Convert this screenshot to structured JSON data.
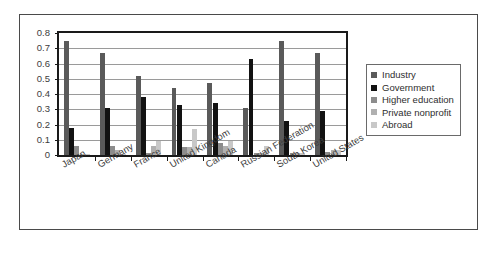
{
  "chart_data": {
    "type": "bar",
    "title": "",
    "subtitle": "",
    "xlabel": "",
    "ylabel": "",
    "ylim": [
      0,
      0.8
    ],
    "grid": true,
    "legend_position": "right",
    "categories": [
      "Japan",
      "Germany",
      "France",
      "United Kingdom",
      "Canada",
      "Russian Federation",
      "South Korea",
      "United States"
    ],
    "ytick_labels": [
      "0",
      "0.1",
      "0.2",
      "0.3",
      "0.4",
      "0.5",
      "0.6",
      "0.7",
      "0.8"
    ],
    "ytick_values": [
      0,
      0.1,
      0.2,
      0.3,
      0.4,
      0.5,
      0.6,
      0.7,
      0.8
    ],
    "series": [
      {
        "name": "Industry",
        "color": "#5a5a5a",
        "values": [
          0.75,
          0.67,
          0.52,
          0.44,
          0.47,
          0.31,
          0.75,
          0.67
        ]
      },
      {
        "name": "Government",
        "color": "#121212",
        "values": [
          0.18,
          0.31,
          0.38,
          0.33,
          0.34,
          0.63,
          0.22,
          0.29
        ]
      },
      {
        "name": "Higher education",
        "color": "#8c8c8c",
        "values": [
          0.06,
          0.06,
          0.01,
          0.05,
          0.08,
          0.01,
          0.01,
          0.02
        ]
      },
      {
        "name": "Private nonprofit",
        "color": "#b0b0b0",
        "values": [
          0.005,
          0.03,
          0.06,
          0.05,
          0.06,
          0.01,
          0.01,
          0.03
        ]
      },
      {
        "name": "Abroad",
        "color": "#c8c8c8",
        "values": [
          0.005,
          0.005,
          0.09,
          0.17,
          0.09,
          0.06,
          0.01,
          0.03
        ]
      }
    ]
  },
  "legend": {
    "items": [
      {
        "label": "Industry"
      },
      {
        "label": "Government"
      },
      {
        "label": "Higher education"
      },
      {
        "label": "Private nonprofit"
      },
      {
        "label": "Abroad"
      }
    ]
  }
}
